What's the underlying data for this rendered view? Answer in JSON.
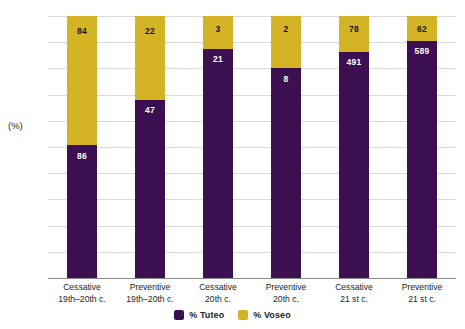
{
  "chart_data": {
    "type": "bar",
    "subtype": "stacked-100-percent",
    "title": "",
    "subtitle": "",
    "xlabel": "",
    "ylabel": "(%)",
    "ylim": [
      0,
      100
    ],
    "ytick_labels": [
      "100",
      "90",
      "80",
      "70",
      "60",
      "50",
      "40",
      "30",
      "20",
      "10",
      "0"
    ],
    "ytick_values": [
      100,
      90,
      80,
      70,
      60,
      50,
      40,
      30,
      20,
      10,
      0
    ],
    "grid": true,
    "legend_position": "bottom-center",
    "categories": [
      "Cessative 19th–20th c.",
      "Preventive 19th–20th c.",
      "Cessative 20th c.",
      "Preventive 20th c.",
      "Cessative 21st c.",
      "Preventive 21st c."
    ],
    "category_lines": [
      [
        "Cessative",
        "19th–20th c."
      ],
      [
        "Preventive",
        "19th–20th c."
      ],
      [
        "Cessative",
        "20th c."
      ],
      [
        "Preventive",
        "20th c."
      ],
      [
        "Cessative",
        "21 st c."
      ],
      [
        "Preventive",
        "21 st c."
      ]
    ],
    "series": [
      {
        "name": "% Tuteo",
        "color": "#3c1050",
        "values": [
          50.6,
          68.1,
          87.5,
          80.0,
          86.3,
          90.5
        ],
        "labels": [
          "86",
          "47",
          "21",
          "8",
          "491",
          "589"
        ]
      },
      {
        "name": "% Voseo",
        "color": "#d4b424",
        "values": [
          49.4,
          31.9,
          12.5,
          20.0,
          13.7,
          9.5
        ],
        "labels": [
          "84",
          "22",
          "3",
          "2",
          "78",
          "62"
        ]
      }
    ]
  },
  "legend": {
    "items": [
      {
        "label": "% Tuteo",
        "color": "#3c1050"
      },
      {
        "label": "% Voseo",
        "color": "#d4b424"
      }
    ]
  },
  "axis": {
    "y_title": "(%)"
  }
}
